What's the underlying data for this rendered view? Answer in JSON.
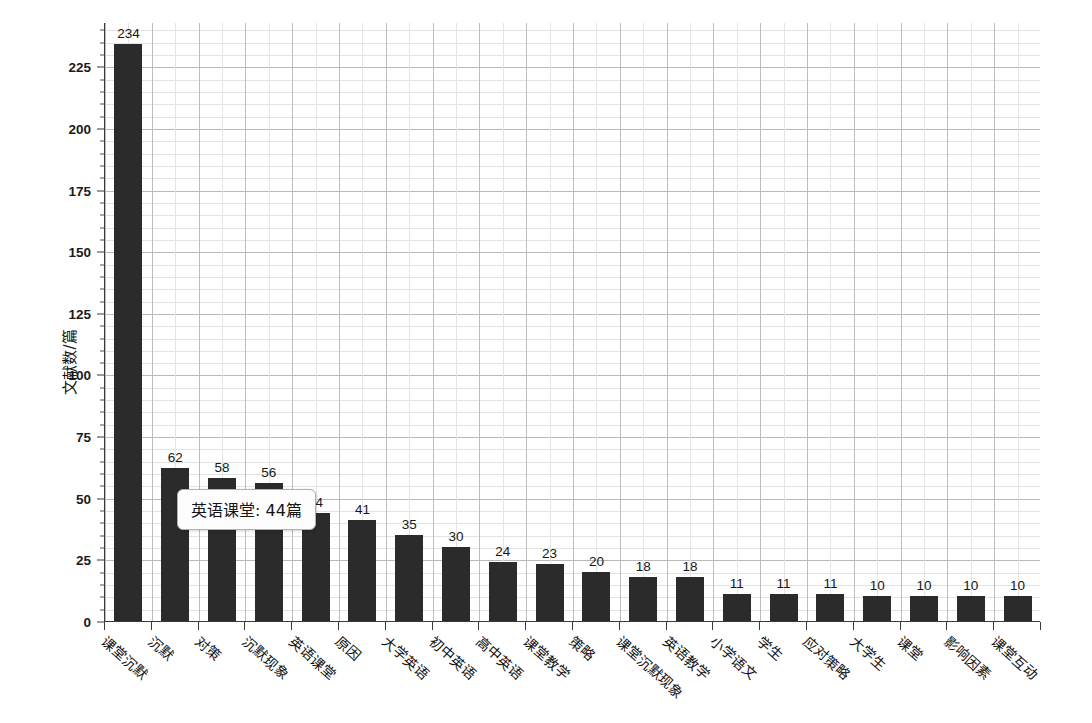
{
  "chart_data": {
    "type": "bar",
    "title": "",
    "xlabel": "",
    "ylabel": "文献数/篇",
    "ylim": [
      0,
      243
    ],
    "ytick_values": [
      0,
      25,
      50,
      75,
      100,
      125,
      150,
      175,
      200,
      225
    ],
    "ytick_labels": [
      "0",
      "25",
      "50",
      "75",
      "100",
      "125",
      "150",
      "175",
      "200",
      "225"
    ],
    "yminor_step": 5,
    "grid": true,
    "legend": null,
    "bar_color": "#2b2b2b",
    "categories": [
      "课堂沉默",
      "沉默",
      "对策",
      "沉默现象",
      "英语课堂",
      "原因",
      "大学英语",
      "初中英语",
      "高中英语",
      "课堂教学",
      "策略",
      "课堂沉默现象",
      "英语教学",
      "小学语文",
      "学生",
      "应对策略",
      "大学生",
      "课堂",
      "影响因素",
      "课堂互动"
    ],
    "values": [
      234,
      62,
      58,
      56,
      44,
      41,
      35,
      30,
      24,
      23,
      20,
      18,
      18,
      11,
      11,
      11,
      10,
      10,
      10,
      10
    ],
    "value_labels": [
      "234",
      "62",
      "58",
      "56",
      "44",
      "41",
      "35",
      "30",
      "24",
      "23",
      "20",
      "18",
      "18",
      "11",
      "11",
      "11",
      "10",
      "10",
      "10",
      "10"
    ]
  },
  "tooltip": {
    "visible": true,
    "category": "英语课堂",
    "separator": ": ",
    "value": "44",
    "unit": "篇",
    "text": "英语课堂: 44篇"
  }
}
